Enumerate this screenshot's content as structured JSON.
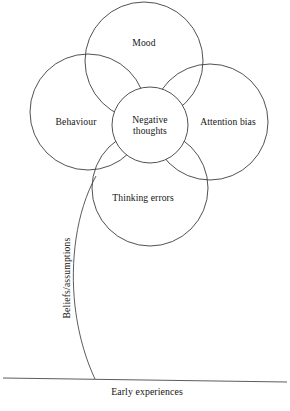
{
  "diagram": {
    "type": "venn-flower-formulation",
    "nodes": [
      {
        "id": "mood",
        "label": "Mood",
        "position": "top",
        "cx": 144,
        "cy": 61,
        "r": 59
      },
      {
        "id": "behaviour",
        "label": "Behaviour",
        "position": "left",
        "cx": 88,
        "cy": 112,
        "r": 58
      },
      {
        "id": "attention-bias",
        "label": "Attention bias",
        "position": "right",
        "cx": 210,
        "cy": 122,
        "r": 58
      },
      {
        "id": "thinking-errors",
        "label": "Thinking errors",
        "position": "bottom",
        "cx": 150,
        "cy": 188,
        "r": 58
      },
      {
        "id": "negative-thoughts",
        "label": "Negative thoughts",
        "label_line_1": "Negative",
        "label_line_2": "thoughts",
        "position": "center",
        "cx": 150,
        "cy": 125,
        "r": 38
      }
    ],
    "stem": {
      "label": "Beliefs/assumptions",
      "orientation": "vertical-bottom-to-top",
      "label_x": 66,
      "label_y": 278
    },
    "baseline": {
      "label": "Early experiences",
      "label_x": 147,
      "label_y": 386,
      "y_left": 378,
      "y_right": 382
    },
    "colors": {
      "stroke": "#3d3d3d",
      "stem_stroke": "#4a4a4a",
      "text": "#141414",
      "background": "#ffffff"
    }
  }
}
